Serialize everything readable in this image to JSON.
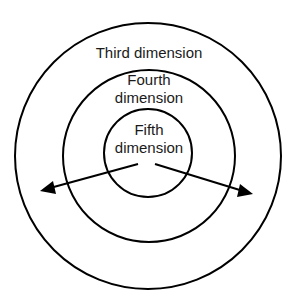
{
  "diagram": {
    "type": "concentric-circles",
    "colors": {
      "background": "#ffffff",
      "stroke": "#000000",
      "text": "#1a1a1a"
    },
    "rings": [
      {
        "name": "third",
        "label_lines": [
          "Third dimension"
        ],
        "cx": 148,
        "cy": 156,
        "r": 133
      },
      {
        "name": "fourth",
        "label_lines": [
          "Fourth",
          "dimension"
        ],
        "cx": 149,
        "cy": 156,
        "r": 86
      },
      {
        "name": "fifth",
        "label_lines": [
          "Fifth",
          "dimension"
        ],
        "cx": 148,
        "cy": 153,
        "r": 44
      }
    ],
    "arrows": [
      {
        "name": "left-arrow",
        "from": [
          138,
          164
        ],
        "to": [
          40,
          191
        ]
      },
      {
        "name": "right-arrow",
        "from": [
          155,
          164
        ],
        "to": [
          253,
          194
        ]
      }
    ]
  }
}
